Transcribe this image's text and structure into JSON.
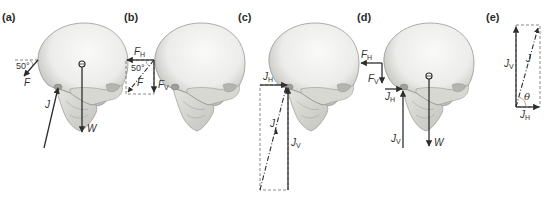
{
  "figure": {
    "colors": {
      "arrow": "#2e2e2e",
      "dashed": "#6a6a6a",
      "skull_light": "#f1f1ee",
      "skull_shadow": "#a9a9a4"
    },
    "panels": [
      {
        "id": "a",
        "label": "(a)",
        "vectors": {
          "F": "F",
          "J": "J",
          "W": "W"
        },
        "angle": "50°"
      },
      {
        "id": "b",
        "label": "(b)",
        "vectors": {
          "F": "F",
          "FH": "F",
          "FH_sub": "H",
          "FV": "F",
          "FV_sub": "V"
        },
        "angle": "50°"
      },
      {
        "id": "c",
        "label": "(c)",
        "vectors": {
          "J": "J",
          "JH": "J",
          "JH_sub": "H",
          "JV": "J",
          "JV_sub": "V"
        }
      },
      {
        "id": "d",
        "label": "(d)",
        "vectors": {
          "FH": "F",
          "FH_sub": "H",
          "FV": "F",
          "FV_sub": "V",
          "JH": "J",
          "JH_sub": "H",
          "JV": "J",
          "JV_sub": "V",
          "W": "W"
        }
      },
      {
        "id": "e",
        "label": "(e)",
        "vectors": {
          "J": "J",
          "JV": "J",
          "JV_sub": "V",
          "JH": "J",
          "JH_sub": "H"
        },
        "angle": "θ"
      }
    ]
  }
}
